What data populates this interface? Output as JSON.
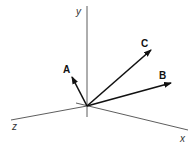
{
  "diagram": {
    "type": "3d-vector-axes",
    "origin": [
      87,
      106
    ],
    "axes": [
      {
        "name": "y",
        "label": "y",
        "end": [
          87,
          6
        ],
        "start": [
          87,
          117
        ]
      },
      {
        "name": "x",
        "label": "x",
        "end": [
          188,
          130
        ],
        "start": [
          76,
          103
        ]
      },
      {
        "name": "z",
        "label": "z",
        "end": [
          11,
          120
        ]
      }
    ],
    "vectors": [
      {
        "name": "A",
        "label": "A",
        "tip": [
          72,
          77
        ]
      },
      {
        "name": "B",
        "label": "B",
        "tip": [
          171,
          83
        ]
      },
      {
        "name": "C",
        "label": "C",
        "tip": [
          151,
          50
        ]
      }
    ],
    "colors": {
      "axis": "#333333",
      "vector": "#111111",
      "background": "#ffffff"
    }
  }
}
